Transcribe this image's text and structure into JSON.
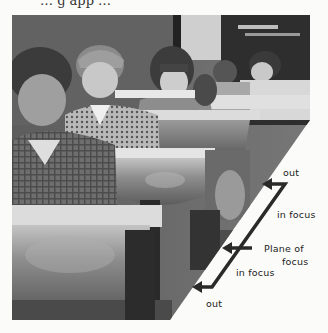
{
  "page": {
    "top_text_fragment": "… g   app …"
  },
  "figure": {
    "annotations": {
      "out_far": "out",
      "in_focus_far": "in focus",
      "plane_of_focus_line1": "Plane of",
      "plane_of_focus_line2": "focus",
      "in_focus_near": "in focus",
      "out_near": "out"
    },
    "colors": {
      "bracket": "#2a2a2a",
      "page": "#fbfbf9"
    }
  }
}
